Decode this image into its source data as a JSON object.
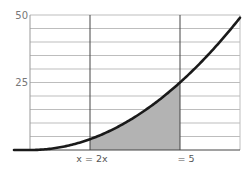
{
  "chart_data": {
    "type": "area",
    "title": "",
    "xlabel": "",
    "ylabel": "",
    "function": "y = x^2",
    "x": [
      -0.5,
      0,
      0.5,
      1,
      1.5,
      2,
      2.5,
      3,
      3.5,
      4,
      4.5,
      5,
      5.5,
      6,
      6.5,
      7
    ],
    "series": [
      {
        "name": "curve",
        "values": [
          0,
          0,
          0.25,
          1,
          2.25,
          4,
          6.25,
          9,
          12.25,
          16,
          20.25,
          25,
          30.25,
          36,
          42.25,
          49
        ]
      }
    ],
    "shaded_region": {
      "x_from": 2,
      "x_to": 5,
      "color": "#b3b3b3"
    },
    "vertical_lines": [
      2,
      5
    ],
    "y_ticks": [
      50,
      25
    ],
    "ylim": [
      0,
      50
    ],
    "xlim": [
      -0.5,
      7
    ],
    "grid": {
      "horizontal": true,
      "step": 5
    },
    "annotations": [
      {
        "text": "x = 2x",
        "at_x": 2
      },
      {
        "text": "= 5",
        "at_x": 5
      }
    ],
    "colors": {
      "curve": "#1a1a1a",
      "shade": "#b3b3b3",
      "grid": "#bdbdbd",
      "vertical": "#444444"
    }
  },
  "labels": {
    "y_top": "50",
    "y_mid": "25",
    "x_left": "x = 2x",
    "x_right": "= 5"
  }
}
